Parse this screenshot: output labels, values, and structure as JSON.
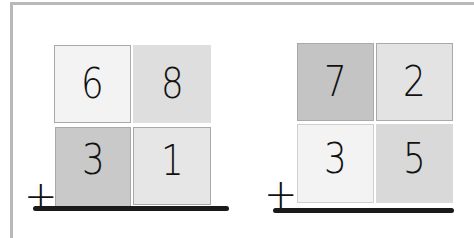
{
  "problems": [
    {
      "operator": "+",
      "top": {
        "tens": "6",
        "ones": "8"
      },
      "bottom": {
        "tens": "3",
        "ones": "1"
      },
      "colors": {
        "top_tens": "#f3f3f3",
        "top_ones": "#dedede",
        "bottom_tens": "#c9c9c9",
        "bottom_ones": "#e6e6e6"
      }
    },
    {
      "operator": "+",
      "top": {
        "tens": "7",
        "ones": "2"
      },
      "bottom": {
        "tens": "3",
        "ones": "5"
      },
      "colors": {
        "top_tens": "#c4c4c4",
        "top_ones": "#e3e3e3",
        "bottom_tens": "#f3f3f3",
        "bottom_ones": "#d9d9d9"
      }
    }
  ]
}
